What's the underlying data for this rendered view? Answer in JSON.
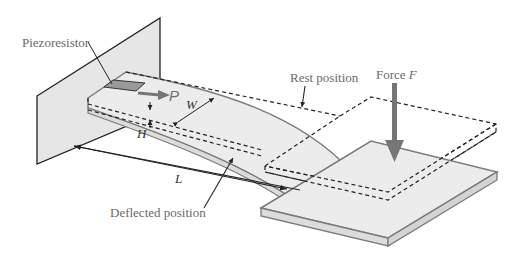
{
  "diagram": {
    "labels": {
      "piezoresistor": "Piezoresistor",
      "rest_position": "Rest position",
      "deflected_position": "Deflected position",
      "force": "Force ",
      "force_symbol": "F",
      "length_symbol": "L",
      "width_symbol": "W",
      "height_symbol": "H",
      "p_symbol": "P"
    },
    "colors": {
      "wall_fill": "#e6e6e6",
      "beam_fill": "#ececec",
      "edge": "#7a7a7a",
      "outline": "#222222",
      "piezoresistor_fill": "#9a9a9a",
      "force_arrow": "#767676",
      "dashed": "#222222"
    }
  }
}
